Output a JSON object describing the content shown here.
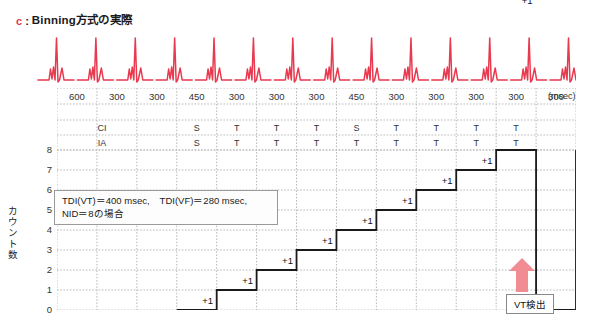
{
  "title": {
    "marker": "c",
    "separator": ":",
    "text": "Binning方式の実際"
  },
  "colors": {
    "ecg_trace": "#e8394f",
    "arrow": "#f08c92",
    "grid": "#b9b9b9",
    "step_line": "#1a1a1a",
    "marker": "#e0394f"
  },
  "intervals": {
    "unit": "(msec)",
    "values": [
      "600",
      "300",
      "300",
      "450",
      "300",
      "300",
      "300",
      "450",
      "300",
      "300",
      "300",
      "300",
      "300"
    ]
  },
  "rows": {
    "ci": {
      "key": "CI",
      "cells": [
        "",
        "",
        "",
        "S",
        "T",
        "T",
        "T",
        "S",
        "T",
        "T",
        "T",
        "T",
        ""
      ]
    },
    "ia": {
      "key": "IA",
      "cells": [
        "",
        "",
        "",
        "S",
        "T",
        "T",
        "T",
        "T",
        "T",
        "T",
        "T",
        "T",
        ""
      ]
    }
  },
  "yaxis": {
    "label": "カウント数",
    "ticks": [
      "8",
      "7",
      "6",
      "5",
      "4",
      "3",
      "2",
      "1",
      "0"
    ],
    "min": 0,
    "max": 8
  },
  "annotation": {
    "line1": "TDI(VT)＝400 msec,　TDI(VF)＝280 msec,",
    "line2": "NID＝8の場合"
  },
  "steps": {
    "increment_label": "+1",
    "counts": [
      0,
      0,
      0,
      0,
      1,
      2,
      3,
      4,
      5,
      6,
      7,
      8
    ]
  },
  "detection": {
    "label": "VT検出",
    "arrow_name": "vt-detection-arrow"
  },
  "chart_data": {
    "type": "line",
    "title": "Binning方式の実際",
    "xlabel": "",
    "ylabel": "カウント数",
    "ylim": [
      0,
      8
    ],
    "categories": [
      "600",
      "300",
      "300",
      "450",
      "300",
      "300",
      "300",
      "450",
      "300",
      "300",
      "300",
      "300",
      "300"
    ],
    "series": [
      {
        "name": "カウント数",
        "values": [
          0,
          0,
          0,
          0,
          1,
          2,
          3,
          4,
          5,
          6,
          7,
          8,
          8
        ]
      }
    ],
    "annotations": [
      "TDI(VT)＝400 msec,　TDI(VF)＝280 msec,",
      "NID＝8の場合",
      "VT検出"
    ],
    "grid": true,
    "legend": "none"
  }
}
